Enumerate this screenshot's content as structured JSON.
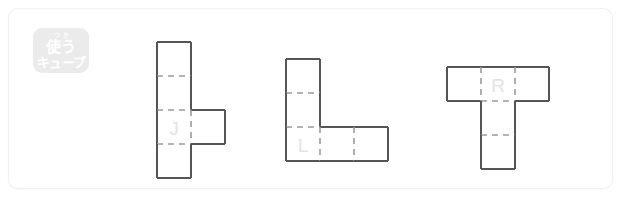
{
  "card": {
    "background": "#ffffff",
    "border_color": "#f0f0f0"
  },
  "badge": {
    "name": "cube-badge",
    "furigana": "つか",
    "line1": "使う",
    "line2": "キューブ",
    "background": "#ebebeb",
    "text_color": "#ffffff"
  },
  "style": {
    "edge_color": "#555555",
    "fold_color": "#9a9a9a",
    "label_color": "#e3e3e3",
    "cell_size": 34
  },
  "nets": [
    {
      "id": "net-j",
      "label": "J",
      "shape": "vertical-four-with-right-tab",
      "x": 148,
      "y": 33,
      "cells": [
        {
          "col": 0,
          "row": 0
        },
        {
          "col": 0,
          "row": 1
        },
        {
          "col": 0,
          "row": 2
        },
        {
          "col": 0,
          "row": 3
        },
        {
          "col": 1,
          "row": 2
        }
      ],
      "label_cell": {
        "col": 0,
        "row": 2
      },
      "cols": 2,
      "rows": 4
    },
    {
      "id": "net-l",
      "label": "L",
      "shape": "l-shape",
      "x": 277,
      "y": 50,
      "cells": [
        {
          "col": 0,
          "row": 0
        },
        {
          "col": 0,
          "row": 1
        },
        {
          "col": 0,
          "row": 2
        },
        {
          "col": 1,
          "row": 2
        },
        {
          "col": 2,
          "row": 2
        }
      ],
      "label_cell": {
        "col": 0,
        "row": 2
      },
      "cols": 3,
      "rows": 3
    },
    {
      "id": "net-r",
      "label": "R",
      "shape": "t-shape",
      "x": 438,
      "y": 58,
      "cells": [
        {
          "col": 0,
          "row": 0
        },
        {
          "col": 1,
          "row": 0
        },
        {
          "col": 2,
          "row": 0
        },
        {
          "col": 1,
          "row": 1
        },
        {
          "col": 1,
          "row": 2
        }
      ],
      "label_cell": {
        "col": 1,
        "row": 0
      },
      "cols": 3,
      "rows": 3
    }
  ]
}
